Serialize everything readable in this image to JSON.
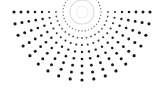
{
  "canvas": {
    "width": 164,
    "height": 91,
    "background": "#ffffff"
  },
  "pattern": {
    "name": "halftone-dot-burst",
    "dot_color": "#1a1a1a",
    "center": {
      "x": 82,
      "y": 12
    },
    "ring_radii": [
      6,
      12,
      19,
      26,
      33,
      40,
      47,
      54,
      61,
      68
    ],
    "dot_radii": [
      0.3,
      0.5,
      0.7,
      0.9,
      1.05,
      1.2,
      1.3,
      1.4,
      1.5,
      1.6
    ],
    "dot_opacities": [
      0.3,
      0.45,
      0.6,
      0.75,
      0.9,
      1,
      1,
      1,
      1,
      1
    ],
    "angle_step_deg": 10,
    "full_circle_max_radius": 19,
    "fan_start_deg": 0,
    "fan_end_deg": 180
  }
}
